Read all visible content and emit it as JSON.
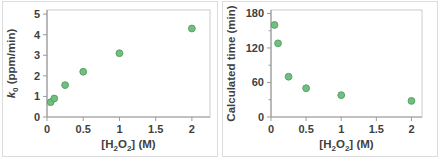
{
  "page": {
    "background": "#ffffff"
  },
  "chart_data": [
    {
      "name": "k0-vs-h2o2-concentration",
      "type": "scatter",
      "title": "",
      "xlabel_parts": [
        {
          "t": "[H"
        },
        {
          "t": "2",
          "style": "sub"
        },
        {
          "t": "O"
        },
        {
          "t": "2",
          "style": "sub"
        },
        {
          "t": "] (M)"
        }
      ],
      "ylabel_parts": [
        {
          "t": "k",
          "style": "italic"
        },
        {
          "t": "0",
          "style": "sub"
        },
        {
          "t": " (ppm/min)"
        }
      ],
      "xlabel_text": "[H2O2] (M)",
      "ylabel_text": "k0 (ppm/min)",
      "x": [
        0.05,
        0.1,
        0.25,
        0.5,
        1,
        2
      ],
      "y": [
        0.72,
        0.9,
        1.55,
        2.2,
        3.1,
        4.3
      ],
      "xlim": [
        0,
        2.25
      ],
      "ylim": [
        0,
        5.2
      ],
      "xticks": [
        0,
        0.5,
        1,
        1.5,
        2
      ],
      "xtick_labels": [
        "0",
        "0.5",
        "1",
        "1.5",
        "2"
      ],
      "yticks": [
        0,
        1,
        2,
        3,
        4,
        5
      ],
      "ytick_labels": [
        "0",
        "1",
        "2",
        "3",
        "4",
        "5"
      ],
      "yminor": [],
      "grid": "off",
      "legend": "none",
      "marker": {
        "fill": "#74bd80",
        "stroke": "#55a465",
        "radius": 3.4
      },
      "colors": {
        "axis": "#9b9b9b",
        "plot_border": "#cccccc",
        "outer_border": "#dcdcdc",
        "text": "#3f3f3f"
      },
      "plot": {
        "left": 45,
        "right": 208,
        "top": 9,
        "bottom": 116
      },
      "size": {
        "w": 216,
        "h": 156
      }
    },
    {
      "name": "calculated-time-vs-h2o2-concentration",
      "type": "scatter",
      "title": "",
      "xlabel_parts": [
        {
          "t": "[H"
        },
        {
          "t": "2",
          "style": "sub"
        },
        {
          "t": "O"
        },
        {
          "t": "2",
          "style": "sub"
        },
        {
          "t": "] (M)"
        }
      ],
      "ylabel_parts": [
        {
          "t": "Calculated time (min)"
        }
      ],
      "xlabel_text": "[H2O2] (M)",
      "ylabel_text": "Calculated time (min)",
      "x": [
        0.05,
        0.1,
        0.25,
        0.5,
        1,
        2
      ],
      "y": [
        160,
        128,
        70,
        50,
        38,
        28
      ],
      "xlim": [
        0,
        2.15
      ],
      "ylim": [
        0,
        186
      ],
      "xticks": [
        0,
        0.5,
        1,
        1.5,
        2
      ],
      "xtick_labels": [
        "0",
        "0.5",
        "1",
        "1.5",
        "2"
      ],
      "yticks": [
        0,
        60,
        120,
        180
      ],
      "ytick_labels": [
        "0",
        "60",
        "120",
        "180"
      ],
      "yminor": [
        30,
        90,
        150
      ],
      "grid": "off",
      "legend": "none",
      "marker": {
        "fill": "#74bd80",
        "stroke": "#55a465",
        "radius": 3.4
      },
      "colors": {
        "axis": "#9b9b9b",
        "plot_border": "#cccccc",
        "outer_border": "#dcdcdc",
        "text": "#3f3f3f"
      },
      "plot": {
        "left": 49,
        "right": 200,
        "top": 9,
        "bottom": 116
      },
      "size": {
        "w": 216,
        "h": 156
      }
    }
  ]
}
